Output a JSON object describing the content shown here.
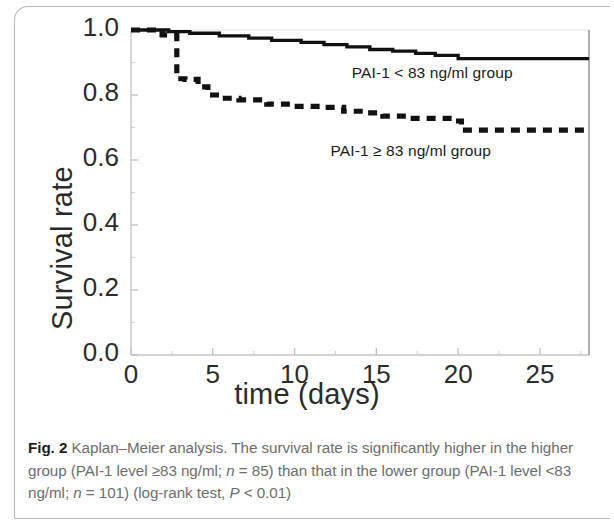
{
  "figure": {
    "caption_label": "Fig. 2",
    "caption_line1": " Kaplan–Meier analysis. The survival rate is significantly higher",
    "caption_line2_a": "in the higher group (PAI-1 level ≥83 ng/ml; ",
    "caption_line2_n": "n",
    "caption_line2_b": " = 85) than that in the",
    "caption_line3_a": "lower group (PAI-1 level <83 ng/ml; ",
    "caption_line3_n": "n",
    "caption_line3_b": " = 101) (log-rank test, ",
    "caption_line3_p": "P",
    "caption_line3_c": " < 0.01)"
  },
  "chart_data": {
    "type": "line",
    "title": "",
    "xlabel": "time (days)",
    "ylabel": "Survival rate",
    "xlim": [
      0,
      28
    ],
    "ylim": [
      0.0,
      1.0
    ],
    "xticks": [
      "0",
      "5",
      "10",
      "15",
      "20",
      "25"
    ],
    "xtick_values": [
      0,
      5,
      10,
      15,
      20,
      25
    ],
    "yticks": [
      "0.0",
      "0.2",
      "0.4",
      "0.6",
      "0.8",
      "1.0"
    ],
    "ytick_values": [
      0.0,
      0.2,
      0.4,
      0.6,
      0.8,
      1.0
    ],
    "grid": false,
    "legend": "in-plot annotations",
    "minor_tick_step": 2.5,
    "series": [
      {
        "name": "PAI-1 < 83 ng/ml group",
        "style": "solid",
        "color": "#111111",
        "annotation": "PAI-1 < 83 ng/ml group",
        "annotation_x": 13.5,
        "annotation_y": 0.865,
        "x": [
          0,
          1,
          2.3,
          3.6,
          5.4,
          7.2,
          8.6,
          10.4,
          11.8,
          13.2,
          14.6,
          16.0,
          17.4,
          18.6,
          20.0,
          28
        ],
        "y": [
          1.0,
          1.0,
          0.995,
          0.99,
          0.982,
          0.975,
          0.968,
          0.962,
          0.955,
          0.948,
          0.94,
          0.935,
          0.928,
          0.922,
          0.912,
          0.912
        ]
      },
      {
        "name": "PAI-1 ≥ 83 ng/ml group",
        "style": "dashed",
        "color": "#111111",
        "annotation": "PAI-1 ≥ 83 ng/ml group",
        "annotation_x": 12.2,
        "annotation_y": 0.625,
        "x": [
          0,
          1.5,
          1.9,
          2.8,
          3.3,
          4.1,
          4.7,
          5.6,
          6.6,
          8.3,
          10.0,
          11.6,
          13.0,
          14.2,
          15.4,
          17.0,
          19.6,
          20.2,
          28
        ],
        "y": [
          1.0,
          1.0,
          0.985,
          0.85,
          0.848,
          0.825,
          0.8,
          0.79,
          0.785,
          0.772,
          0.765,
          0.762,
          0.75,
          0.745,
          0.735,
          0.728,
          0.72,
          0.692,
          0.692
        ]
      }
    ]
  }
}
